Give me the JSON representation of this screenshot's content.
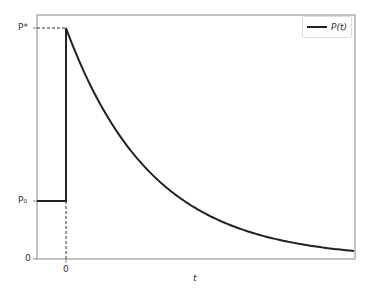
{
  "chart_data": {
    "type": "line",
    "title": "",
    "xlabel": "t",
    "ylabel": "",
    "grid": false,
    "legend_position": "upper right",
    "series": [
      {
        "name": "P(t)",
        "color": "#222222",
        "description": "Constant at P0 for t<0, jumps to P* at t=0, then decays exponentially toward 0",
        "points_normalized": [
          {
            "t": -1.0,
            "P": 0.25
          },
          {
            "t": 0.0,
            "P": 0.25
          },
          {
            "t": 0.0,
            "P": 1.0
          },
          {
            "t": 1.0,
            "P": 0.69
          },
          {
            "t": 2.0,
            "P": 0.47
          },
          {
            "t": 3.0,
            "P": 0.32
          },
          {
            "t": 4.0,
            "P": 0.22
          },
          {
            "t": 5.0,
            "P": 0.15
          },
          {
            "t": 6.0,
            "P": 0.1
          },
          {
            "t": 7.0,
            "P": 0.07
          },
          {
            "t": 8.0,
            "P": 0.05
          },
          {
            "t": 9.0,
            "P": 0.035
          },
          {
            "t": 10.0,
            "P": 0.03
          }
        ]
      }
    ],
    "xticks": [
      "0"
    ],
    "yticks": [
      "0",
      "P₀",
      "P*"
    ],
    "annotations": [
      "dashed horizontal guide from y-axis to peak at P*",
      "dashed vertical guide from x-axis at t=0 up to P0"
    ]
  },
  "labels": {
    "x_axis": "t",
    "y_tick_zero": "0",
    "y_tick_p0": "P₀",
    "y_tick_pstar": "P*",
    "x_tick_zero": "0",
    "legend": "P(t)"
  }
}
